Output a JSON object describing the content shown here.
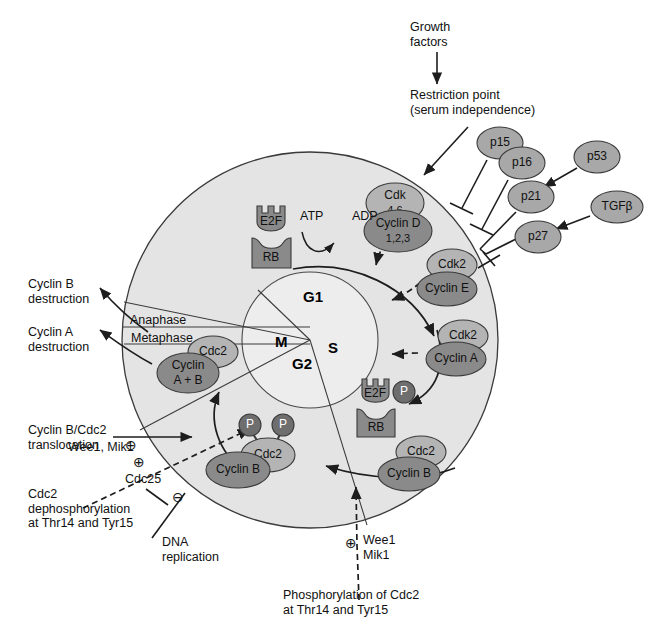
{
  "figure": {
    "type": "biological-pathway-diagram"
  },
  "colors": {
    "disc_outer": "#e3e3e3",
    "disc_inner": "#ededed",
    "cdk_light": "#b4b4b4",
    "cyclin_dark": "#8a8a8a",
    "rb_dark": "#8a8a8a",
    "phosphate": "#6e6e6e",
    "inhibitor_node": "#a8a8a8",
    "stroke": "#2b2b2b"
  },
  "external_labels": {
    "growth_factors": "Growth\nfactors",
    "restriction_point": "Restriction point\n(serum independence)",
    "cyclin_b_destruction": "Cyclin B\ndestruction",
    "cyclin_a_destruction": "Cyclin A\ndestruction",
    "cyclin_b_cdc2_translocation": "Cyclin B/Cdc2\ntranslocation",
    "wee1_mik1_left": "Wee1, Mik1",
    "cdc25": "Cdc25",
    "cdc2_dephosphorylation": "Cdc2\ndephosphorylation\nat Thr14 and Tyr15",
    "dna_replication": "DNA\nreplication",
    "wee1_mik1_bottom": "Wee1\nMik1",
    "phosphorylation_bottom": "Phosphorylation of Cdc2\nat Thr14 and Tyr15"
  },
  "phases": [
    {
      "id": "G1",
      "label": "G1"
    },
    {
      "id": "S",
      "label": "S"
    },
    {
      "id": "G2",
      "label": "G2"
    },
    {
      "id": "M",
      "label": "M"
    }
  ],
  "mitosis_bands": [
    {
      "id": "anaphase",
      "label": "Anaphase"
    },
    {
      "id": "metaphase",
      "label": "Metaphase"
    }
  ],
  "energy_labels": [
    {
      "id": "atp",
      "label": "ATP"
    },
    {
      "id": "adp",
      "label": "ADP"
    }
  ],
  "complexes": [
    {
      "id": "cdk46-cyclind",
      "kinase": "Cdk",
      "kinase_sub": "4,6",
      "cyclin": "Cyclin D",
      "cyclin_sub": "1,2,3"
    },
    {
      "id": "cdk2-cycline",
      "kinase": "Cdk2",
      "kinase_sub": "",
      "cyclin": "Cyclin E",
      "cyclin_sub": ""
    },
    {
      "id": "cdk2-cyclina",
      "kinase": "Cdk2",
      "kinase_sub": "",
      "cyclin": "Cyclin A",
      "cyclin_sub": ""
    },
    {
      "id": "cdc2-cyclinab",
      "kinase": "Cdc2",
      "kinase_sub": "",
      "cyclin": "Cyclin",
      "cyclin_sub": "A + B"
    },
    {
      "id": "cdc2-cyclinb-p",
      "kinase": "Cdc2",
      "kinase_sub": "",
      "cyclin": "Cyclin B",
      "cyclin_sub": ""
    },
    {
      "id": "cdc2-cyclinb",
      "kinase": "Cdc2",
      "kinase_sub": "",
      "cyclin": "Cyclin B",
      "cyclin_sub": ""
    }
  ],
  "rb_complexes": [
    {
      "id": "e2f-rb-bound",
      "e2f": "E2F",
      "rb": "RB",
      "phosphate": null
    },
    {
      "id": "e2f-rb-phospho",
      "e2f": "E2F",
      "rb": "RB",
      "phosphate": "P"
    }
  ],
  "phosphate_groups": [
    {
      "id": "p-thr14",
      "label": "P"
    },
    {
      "id": "p-tyr15",
      "label": "P"
    }
  ],
  "inhibitors": [
    {
      "id": "p15",
      "label": "p15"
    },
    {
      "id": "p16",
      "label": "p16"
    },
    {
      "id": "p21",
      "label": "p21"
    },
    {
      "id": "p27",
      "label": "p27"
    },
    {
      "id": "p53",
      "label": "p53"
    },
    {
      "id": "tgfb",
      "label": "TGFβ"
    }
  ],
  "signs": [
    {
      "id": "wee1-mik1-minus",
      "glyph": "⊖"
    },
    {
      "id": "cdc25-plus",
      "glyph": "⊕"
    },
    {
      "id": "dna-repl-minus",
      "glyph": "⊖"
    },
    {
      "id": "wee1-mik1-plus",
      "glyph": "⊕"
    }
  ]
}
